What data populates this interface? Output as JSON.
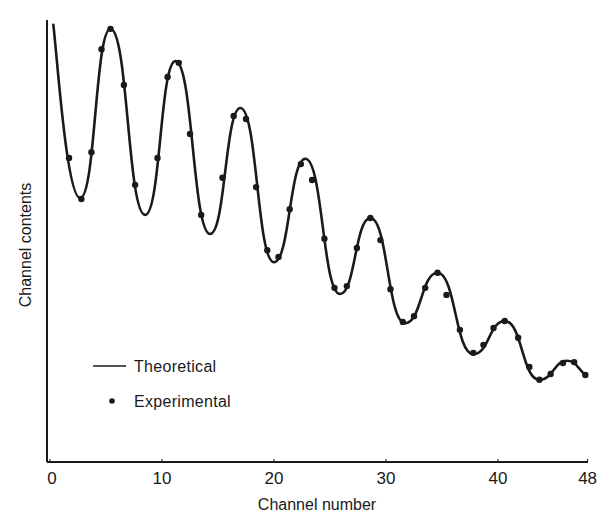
{
  "chart_data": {
    "type": "line",
    "title": "",
    "xlabel": "Channel number",
    "ylabel": "Channel contents",
    "xlim": [
      0,
      48
    ],
    "ylim": [
      0,
      100
    ],
    "x_ticks": [
      0,
      10,
      20,
      30,
      40,
      48
    ],
    "x_tick_labels": [
      "0",
      "10",
      "20",
      "30",
      "40",
      "48"
    ],
    "y_ticks": [],
    "grid": false,
    "legend_position": "lower-left inside",
    "legend": [
      {
        "label": "Theoretical",
        "marker": "line"
      },
      {
        "label": "Experimental",
        "marker": "dot"
      }
    ],
    "colors": {
      "line": "#1a1a1a",
      "dots": "#1a1a1a",
      "axis": "#1a1a1a",
      "background": "#ffffff"
    },
    "series": [
      {
        "name": "Theoretical",
        "kind": "line",
        "x": [
          0.3,
          2.7,
          5.4,
          8.5,
          11.2,
          14.3,
          17.0,
          20.0,
          22.8,
          25.9,
          28.6,
          31.7,
          34.6,
          37.8,
          40.6,
          43.7,
          46.2,
          47.8
        ],
        "y": [
          98.9,
          59.7,
          98.0,
          55.9,
          90.7,
          51.6,
          80.1,
          45.2,
          68.6,
          38.0,
          55.2,
          31.4,
          42.8,
          24.4,
          31.9,
          18.6,
          22.9,
          19.7
        ]
      },
      {
        "name": "Experimental",
        "kind": "scatter",
        "x": [
          1.7,
          2.8,
          3.7,
          4.6,
          5.4,
          6.6,
          7.6,
          9.6,
          10.5,
          11.5,
          12.5,
          13.5,
          15.4,
          16.4,
          17.5,
          18.4,
          19.4,
          20.4,
          21.4,
          22.4,
          23.4,
          24.5,
          25.4,
          26.5,
          27.4,
          28.6,
          29.5,
          30.4,
          31.5,
          32.5,
          33.5,
          34.6,
          35.4,
          36.6,
          37.8,
          38.7,
          39.6,
          40.6,
          41.8,
          42.8,
          43.7,
          44.7,
          45.8,
          46.8,
          47.8
        ],
        "y": [
          68.8,
          59.5,
          70.1,
          93.4,
          98.0,
          85.3,
          62.7,
          68.8,
          87.1,
          90.3,
          74.2,
          55.9,
          64.3,
          78.3,
          77.6,
          62.2,
          47.9,
          46.4,
          57.2,
          67.4,
          63.8,
          50.5,
          39.4,
          39.8,
          48.4,
          55.2,
          50.2,
          39.1,
          31.7,
          33.0,
          39.4,
          42.8,
          37.8,
          29.9,
          24.7,
          26.5,
          30.3,
          31.9,
          28.1,
          21.5,
          18.6,
          19.9,
          22.4,
          22.6,
          19.7
        ]
      }
    ]
  }
}
